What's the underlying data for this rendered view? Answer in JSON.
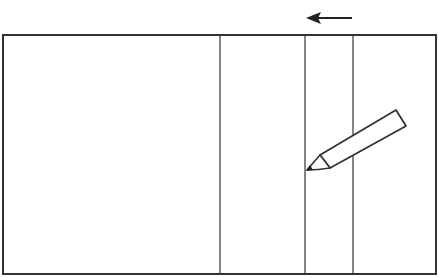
{
  "diagram": {
    "colors": {
      "stroke": "#333333",
      "background": "#ffffff"
    },
    "frame": {
      "x": 3,
      "y": 35,
      "width": 433,
      "height": 239
    },
    "vertical_lines_x": [
      220,
      305,
      353
    ],
    "arrow": {
      "direction": "left",
      "from_x": 352,
      "to_x": 306,
      "y": 18
    },
    "pencil": {
      "tip": [
        306,
        171
      ],
      "icon": "pencil-icon"
    }
  }
}
